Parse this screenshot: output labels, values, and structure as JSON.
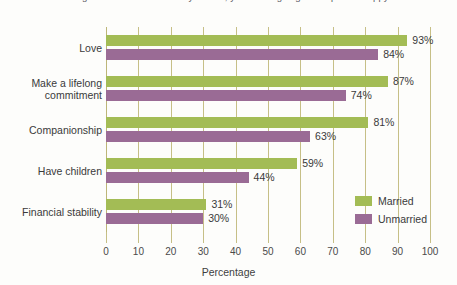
{
  "page": {
    "top_text_fragment": "dislikes and being isolated from the ones you love, your life is going to be quite unhappy."
  },
  "chart_data": {
    "type": "bar",
    "orientation": "horizontal",
    "title": "",
    "xlabel": "Percentage",
    "ylabel": "",
    "xlim": [
      0,
      100
    ],
    "xticks": [
      0,
      10,
      20,
      30,
      40,
      50,
      60,
      70,
      80,
      90,
      100
    ],
    "xtick_labels": [
      "0",
      "10",
      "20",
      "30",
      "40",
      "50",
      "60",
      "70",
      "80",
      "90",
      "100"
    ],
    "grid": true,
    "grid_axis": "x",
    "legend_position": "lower right",
    "categories": [
      "Love",
      "Make a lifelong commitment",
      "Companionship",
      "Have children",
      "Financial stability"
    ],
    "category_display": [
      [
        "Love"
      ],
      [
        "Make a lifelong",
        "commitment"
      ],
      [
        "Companionship"
      ],
      [
        "Have children"
      ],
      [
        "Financial stability"
      ]
    ],
    "series": [
      {
        "name": "Married",
        "color": "#a3bc55",
        "values": [
          93,
          87,
          81,
          59,
          31
        ],
        "value_labels": [
          "93%",
          "87%",
          "81%",
          "59%",
          "31%"
        ]
      },
      {
        "name": "Unmarried",
        "color": "#9a6b95",
        "values": [
          84,
          74,
          63,
          44,
          30
        ],
        "value_labels": [
          "84%",
          "74%",
          "63%",
          "44%",
          "30%"
        ]
      }
    ]
  },
  "colors": {
    "married": "#a3bc55",
    "unmarried": "#9a6b95",
    "gridline": "#c6bf86",
    "text": "#3a3a3a",
    "background": "#fdfdfb"
  },
  "legend": {
    "items": [
      {
        "label": "Married",
        "swatch": "married"
      },
      {
        "label": "Unmarried",
        "swatch": "unmarried"
      }
    ]
  }
}
